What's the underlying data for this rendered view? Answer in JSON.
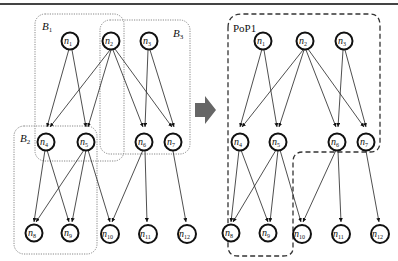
{
  "header": {
    "rule": "top-border-line"
  },
  "left_diagram": {
    "blocks": [
      {
        "id": "B1",
        "label": "B",
        "sub": "1"
      },
      {
        "id": "B2",
        "label": "B",
        "sub": "2"
      },
      {
        "id": "B3",
        "label": "B",
        "sub": "3"
      }
    ],
    "nodes": [
      {
        "id": "n1",
        "label": "n",
        "sub": "1"
      },
      {
        "id": "n2",
        "label": "n",
        "sub": "2"
      },
      {
        "id": "n3",
        "label": "n",
        "sub": "3"
      },
      {
        "id": "n4",
        "label": "n",
        "sub": "4"
      },
      {
        "id": "n5",
        "label": "n",
        "sub": "5"
      },
      {
        "id": "n6",
        "label": "n",
        "sub": "6"
      },
      {
        "id": "n7",
        "label": "n",
        "sub": "7"
      },
      {
        "id": "n8",
        "label": "n",
        "sub": "8"
      },
      {
        "id": "n9",
        "label": "n",
        "sub": "9"
      },
      {
        "id": "n10",
        "label": "n",
        "sub": "10"
      },
      {
        "id": "n11",
        "label": "n",
        "sub": "11"
      },
      {
        "id": "n12",
        "label": "n",
        "sub": "12"
      }
    ]
  },
  "arrow": {
    "icon": "right-arrow-icon",
    "color": "#666666"
  },
  "right_diagram": {
    "pop_label": "PoP1",
    "nodes": [
      {
        "id": "n1",
        "label": "n",
        "sub": "1"
      },
      {
        "id": "n2",
        "label": "n",
        "sub": "2"
      },
      {
        "id": "n3",
        "label": "n",
        "sub": "3"
      },
      {
        "id": "n4",
        "label": "n",
        "sub": "4"
      },
      {
        "id": "n5",
        "label": "n",
        "sub": "5"
      },
      {
        "id": "n6",
        "label": "n",
        "sub": "6"
      },
      {
        "id": "n7",
        "label": "n",
        "sub": "7"
      },
      {
        "id": "n8",
        "label": "n",
        "sub": "8"
      },
      {
        "id": "n9",
        "label": "n",
        "sub": "9"
      },
      {
        "id": "n10",
        "label": "n",
        "sub": "10"
      },
      {
        "id": "n11",
        "label": "n",
        "sub": "11"
      },
      {
        "id": "n12",
        "label": "n",
        "sub": "12"
      }
    ]
  },
  "edges": [
    [
      "n1",
      "n4"
    ],
    [
      "n1",
      "n5"
    ],
    [
      "n2",
      "n4"
    ],
    [
      "n2",
      "n5"
    ],
    [
      "n2",
      "n6"
    ],
    [
      "n2",
      "n7"
    ],
    [
      "n3",
      "n6"
    ],
    [
      "n3",
      "n7"
    ],
    [
      "n4",
      "n8"
    ],
    [
      "n4",
      "n9"
    ],
    [
      "n5",
      "n8"
    ],
    [
      "n5",
      "n9"
    ],
    [
      "n5",
      "n10"
    ],
    [
      "n6",
      "n10"
    ],
    [
      "n6",
      "n11"
    ],
    [
      "n7",
      "n12"
    ]
  ]
}
